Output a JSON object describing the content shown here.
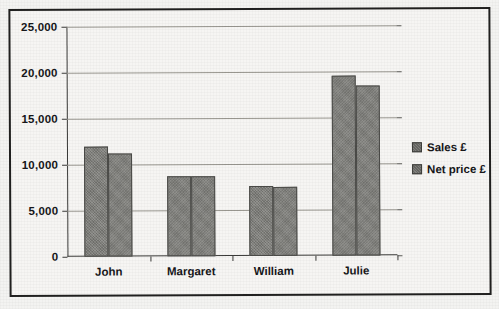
{
  "chart_data": {
    "type": "bar",
    "title": "",
    "xlabel": "",
    "ylabel": "",
    "categories": [
      "John",
      "Margaret",
      "William",
      "Julie"
    ],
    "series": [
      {
        "name": "Sales £",
        "values": [
          11950,
          8750,
          7600,
          19600
        ]
      },
      {
        "name": "Net price £",
        "values": [
          11200,
          8700,
          7550,
          18500
        ]
      }
    ],
    "ylim": [
      0,
      25000
    ],
    "yticks": [
      0,
      5000,
      10000,
      15000,
      20000,
      25000
    ],
    "ytick_labels": [
      "0",
      "5,000",
      "10,000",
      "15,000",
      "20,000",
      "25,000"
    ],
    "grid": true,
    "legend_position": "right",
    "bar_color": "#7e7e7a",
    "bar_edge_color": "#4a4a47",
    "gridline_color": "#98968f",
    "axis_color": "#3a3a38",
    "background_color": "#f6f5f3"
  },
  "legend": {
    "items": [
      {
        "label": "Sales £"
      },
      {
        "label": "Net price £"
      }
    ]
  }
}
